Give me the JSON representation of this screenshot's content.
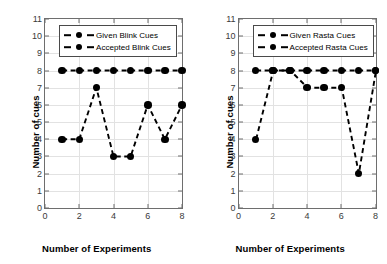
{
  "figure": {
    "background": "#ffffff",
    "marker_color": "#000000",
    "frame_color": "#6e6e6e",
    "grid_color": "#e2e2e2"
  },
  "chart_data": [
    {
      "type": "line",
      "panel": "left",
      "title": "",
      "xlabel": "Number of Experiments",
      "ylabel": "Number of cues",
      "x": [
        1,
        2,
        3,
        4,
        5,
        6,
        7,
        8
      ],
      "xlim": [
        0,
        8
      ],
      "ylim": [
        0,
        11
      ],
      "xticks": [
        0,
        2,
        4,
        6,
        8
      ],
      "yticks": [
        0,
        1,
        2,
        3,
        4,
        5,
        6,
        7,
        8,
        9,
        10,
        11
      ],
      "grid": true,
      "legend_position": "upper left",
      "series": [
        {
          "name": "Given Blink Cues",
          "values": [
            8,
            8,
            8,
            8,
            8,
            8,
            8,
            8
          ],
          "linestyle": "dashed",
          "marker": "o",
          "color": "#000000"
        },
        {
          "name": "Accepted Blink Cues",
          "values": [
            4,
            4,
            7,
            3,
            3,
            6,
            4,
            6
          ],
          "linestyle": "dashed",
          "marker": "o",
          "color": "#000000"
        }
      ]
    },
    {
      "type": "line",
      "panel": "right",
      "title": "",
      "xlabel": "Number of Experiments",
      "ylabel": "Number of cues",
      "x": [
        1,
        2,
        3,
        4,
        5,
        6,
        7,
        8
      ],
      "xlim": [
        0,
        8
      ],
      "ylim": [
        0,
        11
      ],
      "xticks": [
        0,
        2,
        4,
        6,
        8
      ],
      "yticks": [
        0,
        1,
        2,
        3,
        4,
        5,
        6,
        7,
        8,
        9,
        10,
        11
      ],
      "grid": true,
      "legend_position": "upper left",
      "series": [
        {
          "name": "Given Rasta Cues",
          "values": [
            8,
            8,
            8,
            8,
            8,
            8,
            8,
            8
          ],
          "linestyle": "dashed",
          "marker": "o",
          "color": "#000000"
        },
        {
          "name": "Accepted Rasta Cues",
          "values": [
            4,
            8,
            8,
            7,
            7,
            7,
            2,
            8
          ],
          "linestyle": "dashed",
          "marker": "o",
          "color": "#000000"
        }
      ]
    }
  ]
}
